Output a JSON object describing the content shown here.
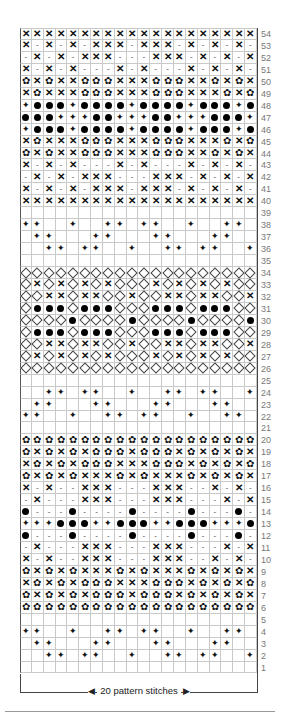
{
  "chart": {
    "columns": 20,
    "legend_symbols": {
      "X": "cross",
      "-": "dash",
      "O": "filled-dot",
      "D": "filled-four-point-star",
      "F": "flower",
      "V": "open-diamond",
      ".": "empty"
    },
    "rows": [
      {
        "n": "54",
        "cells": "XXXXXXXXXXXXXXXXXXXX"
      },
      {
        "n": "53",
        "cells": "X-X-X-XXX-XXX-X-X-X-"
      },
      {
        "n": "52",
        "cells": "-X-X-XXX---XXX-X-X-X"
      },
      {
        "n": "51",
        "cells": "X-X-X---X-X---X-X-X-"
      },
      {
        "n": "50",
        "cells": "FXFXXFFFXXXFFFXXFXFX"
      },
      {
        "n": "49",
        "cells": "XFXXXFFFXXXFFFXXXFXF"
      },
      {
        "n": "48",
        "cells": "DOOODOOOODOOOODOOODO"
      },
      {
        "n": "47",
        "cells": "OOODDDOODDDOODDDOOOD"
      },
      {
        "n": "46",
        "cells": "DOOODOOOODOOOODOOODO"
      },
      {
        "n": "45",
        "cells": "XFXXXFFFXXXFFFXXXFXF"
      },
      {
        "n": "44",
        "cells": "FXFXXFFFXXXFFFXXFXFX"
      },
      {
        "n": "43",
        "cells": "X-X-X---X-X---X-X-X-"
      },
      {
        "n": "42",
        "cells": "-X-X-XXX---XXX-X-X-X"
      },
      {
        "n": "41",
        "cells": "X-X-X-XXX-XXX-X-X-X-"
      },
      {
        "n": "40",
        "cells": "XXXXXXXXXXXXXXXXXXXX"
      },
      {
        "n": "39",
        "cells": "...................."
      },
      {
        "n": "38",
        "cells": "DD..D..DD.DD..D..DD."
      },
      {
        "n": "37",
        "cells": ".DD...DD...DD...DD.."
      },
      {
        "n": "36",
        "cells": "..DD.DD..D..DD.DD..D"
      },
      {
        "n": "35",
        "cells": "...................."
      },
      {
        "n": "34",
        "cells": "VVVVVVVVVVVVVVVVVVVV"
      },
      {
        "n": "33",
        "cells": "VXVXVXVXVVVXVXVXVXVV"
      },
      {
        "n": "32",
        "cells": "VVXXVXXVVXVVXXVXXVVX"
      },
      {
        "n": "31",
        "cells": "VOOOVOOOVVVOOOVOOOVV"
      },
      {
        "n": "30",
        "cells": "VVVVOVVVVOVVVVOVVVVO"
      },
      {
        "n": "29",
        "cells": "VOOOVOOOVVVOOOVOOOVV"
      },
      {
        "n": "28",
        "cells": "VVXXVXXVVXVVXXVXXVVX"
      },
      {
        "n": "27",
        "cells": "VXVXVXVXVVVXVXVXVXVV"
      },
      {
        "n": "26",
        "cells": "VVVVVVVVVVVVVVVVVVVV"
      },
      {
        "n": "25",
        "cells": "...................."
      },
      {
        "n": "24",
        "cells": "..DD.DD..D..DD.DD..D"
      },
      {
        "n": "23",
        "cells": ".DD...DD...DD...DD.."
      },
      {
        "n": "22",
        "cells": "DD..D..DD.DD..D..DD."
      },
      {
        "n": "21",
        "cells": "...................."
      },
      {
        "n": "20",
        "cells": "FFFFFFFFFFFFFFFFFFFF"
      },
      {
        "n": "19",
        "cells": "FXFXFXFFFXFFFXFXFXFX"
      },
      {
        "n": "18",
        "cells": "XFXFXFFFXXXFFFXFXFXF"
      },
      {
        "n": "17",
        "cells": "FXFXFXXXFXFXXXFXFXFX"
      },
      {
        "n": "16",
        "cells": "X-X--XXX---XXX--X-X-"
      },
      {
        "n": "15",
        "cells": "-X---XXX---XXX---X-X"
      },
      {
        "n": "14",
        "cells": "O---O----O----O---O-"
      },
      {
        "n": "13",
        "cells": "DDDOOODDOOODDOOODDDO"
      },
      {
        "n": "12",
        "cells": "O---O----O----O---O-"
      },
      {
        "n": "11",
        "cells": "-X---XXX---XXX---X-X"
      },
      {
        "n": "10",
        "cells": "X-X--XXX---XXX--X-X-"
      },
      {
        "n": "9",
        "cells": "FXFXFXXXFXFXXXFXFXFX"
      },
      {
        "n": "8",
        "cells": "XFXFXFFFXXXFFFXFXFXF"
      },
      {
        "n": "7",
        "cells": "FXFXFXFFFXFFFXFXFXFX"
      },
      {
        "n": "6",
        "cells": "FFFFFFFFFFFFFFFFFFFF"
      },
      {
        "n": "5",
        "cells": "...................."
      },
      {
        "n": "4",
        "cells": "DD..D..DD.DD..D..DD."
      },
      {
        "n": "3",
        "cells": ".DD...DD...DD...DD.."
      },
      {
        "n": "2",
        "cells": "..DD.DD..D..DD.DD..D"
      },
      {
        "n": "1",
        "cells": "...................."
      }
    ]
  },
  "caption": {
    "text": "20 pattern stitches",
    "left_arrow": "◀",
    "right_arrow": "▶"
  }
}
